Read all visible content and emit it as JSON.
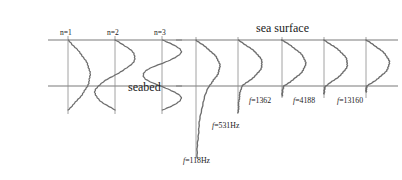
{
  "figure": {
    "title_surface": "sea surface",
    "title_seabed": "seabed",
    "left_panel": {
      "name": "idealized-modes",
      "mode_labels": [
        "n=1",
        "n=2",
        "n=3"
      ],
      "axis_x": [
        68,
        115,
        162
      ],
      "surface_y": 40,
      "seabed_y": 86,
      "modes": [
        {
          "label": "n=1",
          "half_cycles": 1,
          "amplitude": 22,
          "axis_x": 68
        },
        {
          "label": "n=2",
          "half_cycles": 2,
          "amplitude": 20,
          "axis_x": 115
        },
        {
          "label": "n=3",
          "half_cycles": 3,
          "amplitude": 19,
          "axis_x": 162
        }
      ]
    },
    "right_panel": {
      "name": "realistic-modes",
      "surface_y": 40,
      "seabed_y": 86,
      "curves": [
        {
          "label": "f=118Hz",
          "freq": 118,
          "axis_x": 196,
          "amplitude": 20,
          "tail_depth": 72,
          "tail_amp": 13,
          "label_x": 183,
          "label_y": 163
        },
        {
          "label": "f=531Hz",
          "freq": 531,
          "axis_x": 238,
          "amplitude": 23,
          "tail_depth": 27,
          "tail_amp": 4,
          "label_x": 212,
          "label_y": 128
        },
        {
          "label": "f=1362",
          "freq": 1362,
          "axis_x": 282,
          "amplitude": 23,
          "tail_depth": 10,
          "tail_amp": 2,
          "label_x": 249,
          "label_y": 103
        },
        {
          "label": "f=4188",
          "freq": 4188,
          "axis_x": 324,
          "amplitude": 23,
          "tail_depth": 8,
          "tail_amp": 1.5,
          "label_x": 293,
          "label_y": 103
        },
        {
          "label": "f=13160",
          "freq": 13160,
          "axis_x": 366,
          "amplitude": 23,
          "tail_depth": 6,
          "tail_amp": 1,
          "label_x": 337,
          "label_y": 103
        }
      ]
    },
    "colors": {
      "curve": "#6d6d6d",
      "axis": "#8a8a8a",
      "boundary": "#7a7a7a",
      "text": "#1a1a1a",
      "background": "#ffffff"
    },
    "geometry": {
      "width": 402,
      "height": 180,
      "left_surface_x0": 48,
      "left_surface_x1": 182,
      "left_seabed_x0": 48,
      "left_seabed_x1": 182,
      "right_surface_x0": 176,
      "right_surface_x1": 398,
      "right_seabed_x0": 176,
      "right_seabed_x1": 398,
      "seabed_label_x": 128,
      "seabed_label_y": 91,
      "surface_label_x": 256,
      "surface_label_y": 32
    }
  }
}
